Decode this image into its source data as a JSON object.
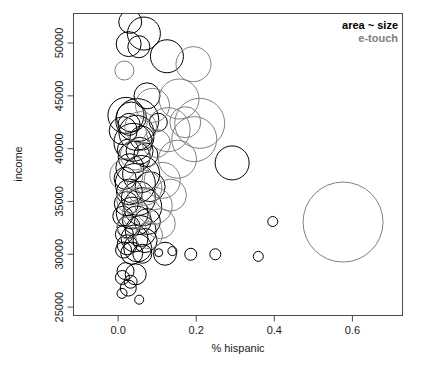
{
  "chart_data": {
    "type": "scatter",
    "title": "",
    "xlabel": "% hispanic",
    "ylabel": "income",
    "xlim": [
      -0.113,
      0.727
    ],
    "ylim": [
      24250,
      52750
    ],
    "xticks": [
      "0.0",
      "0.2",
      "0.4",
      "0.6"
    ],
    "xtick_values": [
      0.0,
      0.2,
      0.4,
      0.6
    ],
    "yticks": [
      "25000",
      "30000",
      "35000",
      "40000",
      "45000",
      "50000"
    ],
    "ytick_values": [
      25000,
      30000,
      35000,
      40000,
      45000,
      50000
    ],
    "grid": false,
    "size_encoding": "area ~ size",
    "legend": {
      "position": "top-right",
      "entries": [
        {
          "label": "area ~ size",
          "color": "#000000"
        },
        {
          "label": "e-touch",
          "color": "#808080"
        }
      ]
    },
    "series": [
      {
        "name": "area ~ size",
        "color": "#000000",
        "points": [
          {
            "x": 0.031,
            "y": 52000,
            "r": 11.5
          },
          {
            "x": 0.066,
            "y": 50900,
            "r": 16.5
          },
          {
            "x": 0.027,
            "y": 49900,
            "r": 12.5
          },
          {
            "x": 0.053,
            "y": 49650,
            "r": 11.0
          },
          {
            "x": 0.125,
            "y": 48750,
            "r": 16.5
          },
          {
            "x": 0.074,
            "y": 45000,
            "r": 13.0
          },
          {
            "x": 0.02,
            "y": 43150,
            "r": 18.0
          },
          {
            "x": 0.034,
            "y": 43000,
            "r": 15.0
          },
          {
            "x": 0.049,
            "y": 42700,
            "r": 21.5
          },
          {
            "x": 0.028,
            "y": 42300,
            "r": 11.0
          },
          {
            "x": 0.103,
            "y": 42500,
            "r": 9.0
          },
          {
            "x": 0.047,
            "y": 41500,
            "r": 17.5
          },
          {
            "x": 0.013,
            "y": 41700,
            "r": 14.0
          },
          {
            "x": 0.061,
            "y": 41000,
            "r": 12.0
          },
          {
            "x": 0.038,
            "y": 40600,
            "r": 19.0
          },
          {
            "x": 0.025,
            "y": 39900,
            "r": 10.5
          },
          {
            "x": 0.055,
            "y": 39800,
            "r": 13.5
          },
          {
            "x": 0.041,
            "y": 39200,
            "r": 16.0
          },
          {
            "x": 0.071,
            "y": 39400,
            "r": 12.0
          },
          {
            "x": 0.292,
            "y": 38650,
            "r": 17.0
          },
          {
            "x": 0.03,
            "y": 38200,
            "r": 14.0
          },
          {
            "x": 0.059,
            "y": 37600,
            "r": 18.5
          },
          {
            "x": 0.018,
            "y": 37200,
            "r": 11.0
          },
          {
            "x": 0.044,
            "y": 36700,
            "r": 20.0
          },
          {
            "x": 0.082,
            "y": 36400,
            "r": 15.0
          },
          {
            "x": 0.029,
            "y": 35900,
            "r": 13.0
          },
          {
            "x": 0.052,
            "y": 35300,
            "r": 17.0
          },
          {
            "x": 0.021,
            "y": 34800,
            "r": 12.0
          },
          {
            "x": 0.063,
            "y": 34500,
            "r": 19.0
          },
          {
            "x": 0.036,
            "y": 33900,
            "r": 16.0
          },
          {
            "x": 0.012,
            "y": 33600,
            "r": 10.0
          },
          {
            "x": 0.048,
            "y": 33200,
            "r": 14.5
          },
          {
            "x": 0.075,
            "y": 33100,
            "r": 13.0
          },
          {
            "x": 0.027,
            "y": 32600,
            "r": 11.5
          },
          {
            "x": 0.058,
            "y": 32200,
            "r": 15.5
          },
          {
            "x": 0.016,
            "y": 31900,
            "r": 9.0
          },
          {
            "x": 0.042,
            "y": 31500,
            "r": 13.5
          },
          {
            "x": 0.069,
            "y": 31300,
            "r": 12.0
          },
          {
            "x": 0.023,
            "y": 30900,
            "r": 10.0
          },
          {
            "x": 0.05,
            "y": 30600,
            "r": 14.0
          },
          {
            "x": 0.014,
            "y": 30400,
            "r": 8.0
          },
          {
            "x": 0.035,
            "y": 30100,
            "r": 11.0
          },
          {
            "x": 0.062,
            "y": 30050,
            "r": 9.5
          },
          {
            "x": 0.12,
            "y": 30050,
            "r": 11.5
          },
          {
            "x": 0.104,
            "y": 30150,
            "r": 4.0
          },
          {
            "x": 0.139,
            "y": 30300,
            "r": 4.5
          },
          {
            "x": 0.186,
            "y": 30000,
            "r": 6.0
          },
          {
            "x": 0.249,
            "y": 30000,
            "r": 5.5
          },
          {
            "x": 0.359,
            "y": 29800,
            "r": 5.0
          },
          {
            "x": 0.396,
            "y": 33100,
            "r": 5.0
          },
          {
            "x": 0.019,
            "y": 28400,
            "r": 8.5
          },
          {
            "x": 0.045,
            "y": 28100,
            "r": 10.5
          },
          {
            "x": 0.011,
            "y": 27800,
            "r": 7.0
          },
          {
            "x": 0.032,
            "y": 27400,
            "r": 6.5
          },
          {
            "x": 0.026,
            "y": 26800,
            "r": 8.0
          },
          {
            "x": 0.01,
            "y": 26300,
            "r": 5.0
          },
          {
            "x": 0.054,
            "y": 25700,
            "r": 4.5
          }
        ]
      },
      {
        "name": "e-touch",
        "color": "#808080",
        "points": [
          {
            "x": 0.016,
            "y": 47400,
            "r": 9.5
          },
          {
            "x": 0.193,
            "y": 48000,
            "r": 17.5
          },
          {
            "x": 0.156,
            "y": 44700,
            "r": 20.0
          },
          {
            "x": 0.088,
            "y": 44100,
            "r": 17.0
          },
          {
            "x": 0.209,
            "y": 42400,
            "r": 25.0
          },
          {
            "x": 0.172,
            "y": 42500,
            "r": 15.5
          },
          {
            "x": 0.128,
            "y": 41800,
            "r": 22.0
          },
          {
            "x": 0.058,
            "y": 42000,
            "r": 16.0
          },
          {
            "x": 0.195,
            "y": 40900,
            "r": 22.5
          },
          {
            "x": 0.098,
            "y": 40500,
            "r": 14.0
          },
          {
            "x": 0.044,
            "y": 39400,
            "r": 15.0
          },
          {
            "x": 0.152,
            "y": 39000,
            "r": 19.0
          },
          {
            "x": 0.021,
            "y": 37500,
            "r": 16.5
          },
          {
            "x": 0.113,
            "y": 37000,
            "r": 18.0
          },
          {
            "x": 0.067,
            "y": 36300,
            "r": 17.5
          },
          {
            "x": 0.134,
            "y": 35600,
            "r": 16.0
          },
          {
            "x": 0.03,
            "y": 35100,
            "r": 13.0
          },
          {
            "x": 0.091,
            "y": 34600,
            "r": 18.5
          },
          {
            "x": 0.046,
            "y": 33800,
            "r": 14.0
          },
          {
            "x": 0.108,
            "y": 32900,
            "r": 15.0
          },
          {
            "x": 0.025,
            "y": 32500,
            "r": 11.0
          },
          {
            "x": 0.079,
            "y": 31800,
            "r": 13.5
          },
          {
            "x": 0.576,
            "y": 33050,
            "r": 40.0
          }
        ]
      }
    ]
  },
  "axes": {
    "x_label": "% hispanic",
    "y_label": "income"
  }
}
